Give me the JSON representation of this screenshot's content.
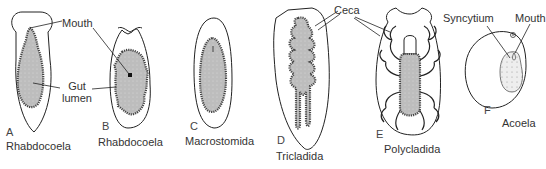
{
  "figure": {
    "panels": [
      {
        "letter": "A",
        "taxon": "Rhabdocoela"
      },
      {
        "letter": "B",
        "taxon": "Rhabdocoela"
      },
      {
        "letter": "C",
        "taxon": "Macrostomida"
      },
      {
        "letter": "D",
        "taxon": "Tricladida"
      },
      {
        "letter": "E",
        "taxon": "Polycladida"
      },
      {
        "letter": "F",
        "taxon": "Acoela"
      }
    ],
    "callouts": {
      "mouth_ab": "Mouth",
      "gut_lumen_line1": "Gut",
      "gut_lumen_line2": "lumen",
      "ceca": "Ceca",
      "syncytium": "Syncytium",
      "mouth_f": "Mouth"
    },
    "colors": {
      "outline": "#222222",
      "gut_fill": "#b8b8b8",
      "gut_wall": "#555555",
      "background": "#ffffff"
    }
  }
}
